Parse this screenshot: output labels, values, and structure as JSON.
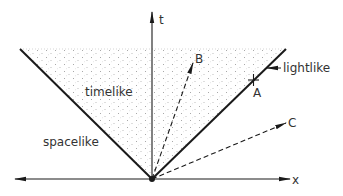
{
  "diagram": {
    "axes": {
      "t_label": "t",
      "x_label": "x"
    },
    "regions": {
      "timelike": "timelike",
      "spacelike": "spacelike",
      "lightlike": "lightlike"
    },
    "points": {
      "A": "A",
      "B": "B",
      "C": "C"
    },
    "colors": {
      "line": "#1a1a1a",
      "text": "#333333",
      "stipple": "#9a9a9a",
      "background": "#ffffff"
    }
  }
}
